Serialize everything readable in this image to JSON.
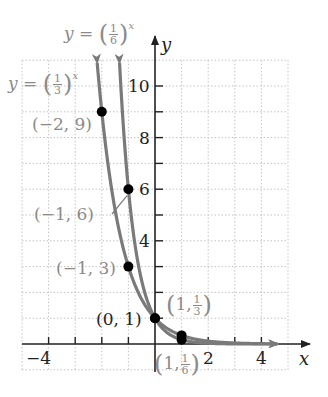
{
  "chart_data": {
    "type": "line",
    "title": "",
    "xlabel": "x",
    "ylabel": "y",
    "xlim": [
      -5,
      5
    ],
    "ylim": [
      -1,
      11
    ],
    "grid": true,
    "x_ticks": [
      -4,
      -3,
      -2,
      -1,
      1,
      2,
      3,
      4
    ],
    "x_tick_labels": [
      "-4",
      "2",
      "4"
    ],
    "y_ticks": [
      1,
      2,
      3,
      4,
      5,
      6,
      7,
      8,
      9,
      10
    ],
    "y_tick_labels": [
      "2",
      "4",
      "6",
      "8",
      "10"
    ],
    "series": [
      {
        "name": "y = (1/3)^x",
        "base": "1/3",
        "points": [
          {
            "x": -2,
            "y": 9,
            "label": "(-2, 9)"
          },
          {
            "x": -1,
            "y": 3,
            "label": "(-1, 3)"
          },
          {
            "x": 0,
            "y": 1,
            "label": "(0, 1)"
          },
          {
            "x": 1,
            "y": 0.3333,
            "label": "(1, 1/3)"
          }
        ]
      },
      {
        "name": "y = (1/6)^x",
        "base": "1/6",
        "points": [
          {
            "x": -1,
            "y": 6,
            "label": "(-1, 6)"
          },
          {
            "x": 0,
            "y": 1,
            "label": "(0, 1)"
          },
          {
            "x": 1,
            "y": 0.1667,
            "label": "(1, 1/6)"
          }
        ]
      }
    ],
    "annotations": [
      "(-2, 9)",
      "(-1, 6)",
      "(-1, 3)",
      "(0, 1)",
      "(1, 1/3)",
      "(1, 1/6)"
    ]
  },
  "labels": {
    "eq_sixth": {
      "y": "y",
      "eq": "=",
      "num": "1",
      "den": "6",
      "exp": "x"
    },
    "eq_third": {
      "y": "y",
      "eq": "=",
      "num": "1",
      "den": "3",
      "exp": "x"
    },
    "axis_x": "x",
    "axis_y": "y",
    "tick_10": "10",
    "tick_8": "8",
    "tick_6": "6",
    "tick_4": "4",
    "tick_2": "2",
    "tick_neg4": "−4",
    "tick_x2": "2",
    "tick_x4": "4",
    "pt_m2_9": "(−2, 9)",
    "pt_m1_6": "(−1, 6)",
    "pt_m1_3": "(−1, 3)",
    "pt_0_1": "(0, 1)",
    "pt_1_third": {
      "pre": "1,",
      "num": "1",
      "den": "3"
    },
    "pt_1_sixth": {
      "pre": "1,",
      "num": "1",
      "den": "6"
    }
  },
  "colors": {
    "curve": "#7a7a7a",
    "axis": "#222222",
    "grid": "#bbbbbb",
    "point": "#000000",
    "label_gray": "#8a8a8a"
  }
}
